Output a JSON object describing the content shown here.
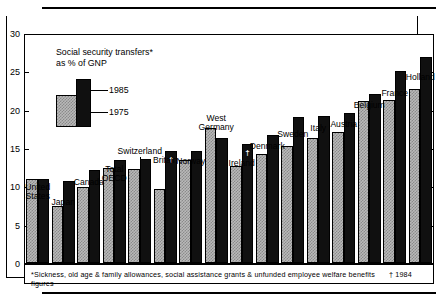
{
  "legend": {
    "title": "Social security transfers*\nas % of GNP",
    "items": [
      {
        "key": "1985",
        "label": "1985",
        "style": "dark-solid"
      },
      {
        "key": "1975",
        "label": "1975",
        "style": "light-checkered"
      }
    ]
  },
  "axis": {
    "y_ticks": [
      "0",
      "5",
      "10",
      "15",
      "20",
      "25",
      "30"
    ],
    "y_min": 0,
    "y_max": 30
  },
  "footnote": {
    "text": "*Sickness, old age & family allowances, social assistance grants & unfunded employee welfare benefits",
    "text2": "† 1984 figures"
  },
  "markers": {
    "dagger": "†"
  },
  "chart_data": {
    "type": "bar",
    "title": "Social security transfers* as % of GNP",
    "xlabel": "",
    "ylabel": "% of GNP",
    "ylim": [
      0,
      30
    ],
    "ytick_step": 5,
    "grid": false,
    "legend_position": "inside-top-left",
    "categories": [
      "United States",
      "Japan",
      "Canada",
      "Total OECD",
      "Switzerland",
      "Britain",
      "Norway",
      "West Germany",
      "Ireland",
      "Denmark",
      "Sweden",
      "Italy",
      "Austria",
      "Belgium",
      "France",
      "Holland"
    ],
    "category_labels": [
      "United\nStates",
      "Japan",
      "Canada",
      "Total\nOECD",
      "Switzerland",
      "Britain",
      "Norway",
      "West\nGermany",
      "Ireland",
      "Denmark",
      "Sweden",
      "Italy",
      "Austria",
      "Belgium",
      "France",
      "Holland"
    ],
    "series": [
      {
        "name": "1975",
        "style": "light-checkered",
        "values": [
          11.0,
          7.5,
          10.0,
          12.5,
          12.4,
          9.7,
          13.5,
          17.7,
          12.7,
          14.3,
          15.4,
          16.5,
          17.2,
          21.3,
          21.4,
          22.9
        ]
      },
      {
        "name": "1985",
        "style": "dark-solid",
        "values": [
          11.0,
          10.8,
          12.2,
          13.5,
          13.7,
          14.8,
          14.8,
          16.5,
          15.6,
          16.9,
          19.2,
          19.3,
          19.7,
          22.2,
          25.2,
          27.1
        ]
      }
    ],
    "annotations": [
      {
        "category": "Britain",
        "series": "1985",
        "marker": "†",
        "note": "1984 figures"
      },
      {
        "category": "Ireland",
        "series": "1985",
        "marker": "†",
        "note": "1984 figures"
      }
    ]
  }
}
